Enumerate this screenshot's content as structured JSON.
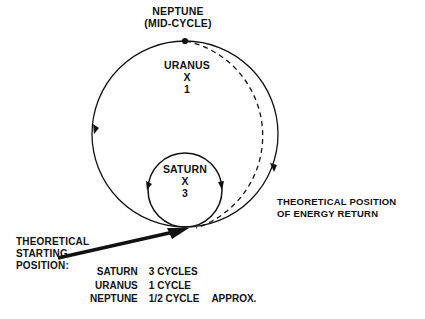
{
  "diagram": {
    "title_labels": {
      "neptune": "NEPTUNE\n(MID-CYCLE)",
      "uranus": "URANUS\nX\n1",
      "saturn": "SATURN\nX\n3",
      "energy_return": "THEORETICAL POSITION\nOF ENERGY RETURN",
      "starting_position": "THEORETICAL\nSTARTING\nPOSITION:"
    },
    "cycles": {
      "rows": [
        {
          "body": "SATURN",
          "count": "3 CYCLES",
          "note": ""
        },
        {
          "body": "URANUS",
          "count": "1 CYCLE",
          "note": ""
        },
        {
          "body": "NEPTUNE",
          "count": "1/2 CYCLE",
          "note": "APPROX."
        }
      ]
    },
    "colors": {
      "ink": "#111111",
      "background": "#ffffff"
    },
    "geometry": {
      "outer_circle": {
        "cx": 185,
        "cy": 134,
        "r": 93
      },
      "inner_circle": {
        "cx": 185,
        "cy": 190,
        "r": 37
      },
      "dashed_arc_note": "offset arc outside outer circle on right side"
    }
  }
}
